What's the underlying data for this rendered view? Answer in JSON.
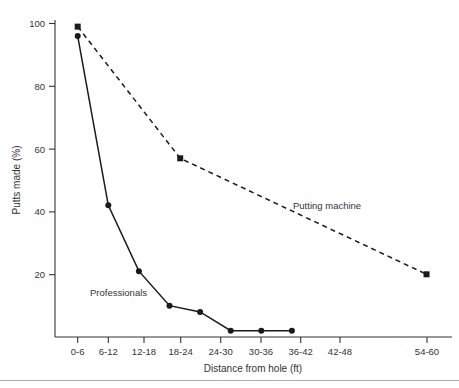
{
  "chart_data": {
    "type": "line",
    "title": "",
    "xlabel": "Distance from hole (ft)",
    "ylabel": "Putts made (%)",
    "categories": [
      "0-6",
      "6-12",
      "12-18",
      "18-24",
      "24-30",
      "30-36",
      "36-42",
      "42-48",
      "48-54",
      "54-60"
    ],
    "xtick_labels": [
      "0-6",
      "6-12",
      "12-18",
      "18-24",
      "24-30",
      "30-36",
      "36-42",
      "42-48",
      "54-60"
    ],
    "ytick_labels": [
      "20",
      "40",
      "60",
      "80",
      "100"
    ],
    "ytick_values": [
      20,
      40,
      60,
      80,
      100
    ],
    "ylim": [
      0,
      103
    ],
    "xlim": [
      0,
      9
    ],
    "grid": false,
    "legend": "inline-annotations",
    "series": [
      {
        "name": "Putting machine",
        "style": "dashed",
        "marker": "square",
        "label_x": 9,
        "points": [
          {
            "category": "0-6",
            "x": 0,
            "value": 99
          },
          {
            "category": "18-24",
            "x": 3.35,
            "value": 57
          },
          {
            "category": "54-60",
            "x": 11.4,
            "value": 20
          }
        ]
      },
      {
        "name": "Professionals",
        "style": "solid",
        "marker": "circle",
        "points": [
          {
            "category": "0-6",
            "x": 0,
            "value": 96
          },
          {
            "category": "6-12",
            "x": 1,
            "value": 42
          },
          {
            "category": "12-18",
            "x": 2,
            "value": 21
          },
          {
            "category": "18-24",
            "x": 3,
            "value": 10
          },
          {
            "category": "24-30",
            "x": 4,
            "value": 8
          },
          {
            "category": "30-36",
            "x": 5,
            "value": 2
          },
          {
            "category": "36-42",
            "x": 6,
            "value": 2
          },
          {
            "category": "42-48",
            "x": 7,
            "value": 2
          }
        ]
      }
    ],
    "annotations": [
      {
        "name": "putting-machine-label",
        "text": "Putting machine"
      },
      {
        "name": "professionals-label",
        "text": "Professionals"
      }
    ]
  }
}
